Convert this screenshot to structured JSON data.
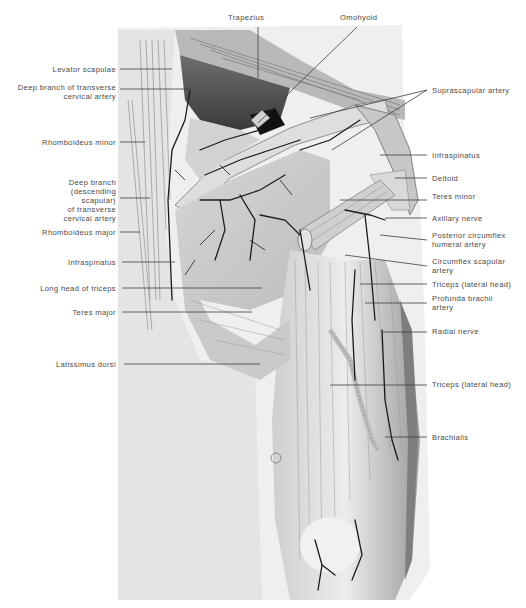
{
  "figure": {
    "background": "#ffffff",
    "illustration_tone": "#9a9a9a",
    "artery_color": "#1a1a1a",
    "label_color": "#4a4a4a"
  },
  "labels": {
    "top": [
      {
        "id": "trapezius",
        "text": "Trapezius"
      },
      {
        "id": "omohyoid",
        "text": "Omohyoid"
      }
    ],
    "left": [
      {
        "id": "levator-scapulae",
        "text": "Levator scapulae"
      },
      {
        "id": "deep-branch-tca-1",
        "text": "Deep branch of transverse",
        "text2": "cervical artery"
      },
      {
        "id": "rhomboideus-minor",
        "text": "Rhomboideus minor"
      },
      {
        "id": "deep-branch-desc",
        "text": "Deep branch",
        "text2": "(descending",
        "text3": "scapular)",
        "text4": "of transverse",
        "text5": "cervical artery"
      },
      {
        "id": "rhomboideus-major",
        "text": "Rhomboideus major"
      },
      {
        "id": "infraspinatus-left",
        "text": "Infraspinatus"
      },
      {
        "id": "long-head-triceps",
        "text": "Long head of triceps"
      },
      {
        "id": "teres-major",
        "text": "Teres major"
      },
      {
        "id": "latissimus-dorsi",
        "text": "Latissimus dorsi"
      }
    ],
    "right": [
      {
        "id": "suprascapular-artery",
        "text": "Suprascapular artery"
      },
      {
        "id": "infraspinatus-right",
        "text": "Infraspinatus"
      },
      {
        "id": "deltoid",
        "text": "Deltoid"
      },
      {
        "id": "teres-minor",
        "text": "Teres minor"
      },
      {
        "id": "axillary-nerve",
        "text": "Axillary nerve"
      },
      {
        "id": "post-circumflex-humeral",
        "text": "Posterior circumflex",
        "text2": "humeral artery"
      },
      {
        "id": "circumflex-scapular",
        "text": "Circumflex scapular",
        "text2": "artery"
      },
      {
        "id": "triceps-lateral-1",
        "text": "Triceps (lateral head)"
      },
      {
        "id": "profunda-brachii",
        "text": "Profunda brachii",
        "text2": "artery"
      },
      {
        "id": "radial-nerve",
        "text": "Radial nerve"
      },
      {
        "id": "triceps-lateral-2",
        "text": "Triceps (lateral head)"
      },
      {
        "id": "brachialis",
        "text": "Brachialis"
      }
    ]
  }
}
